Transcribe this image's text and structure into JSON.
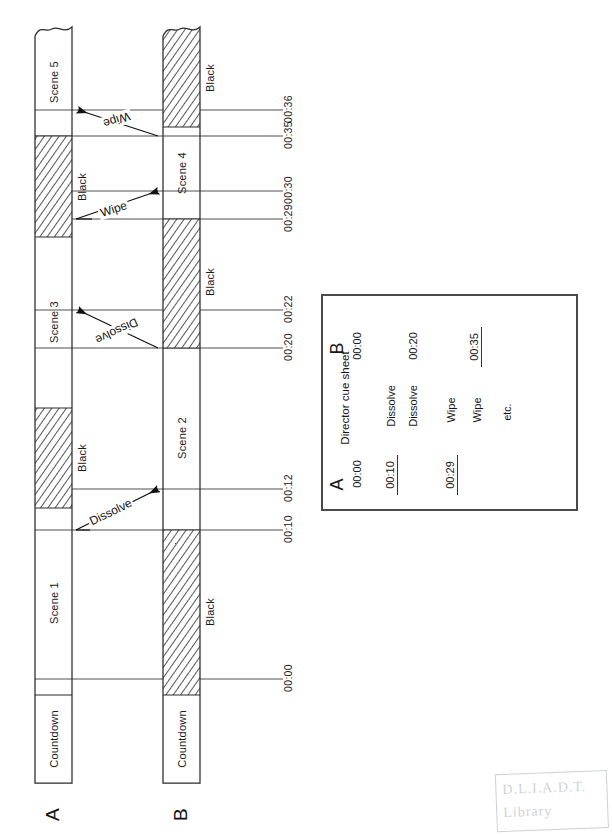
{
  "figure": {
    "type": "ab-roll-timeline-diagram",
    "tracks": [
      {
        "id": "A",
        "label": "A",
        "x": 35,
        "width": 37,
        "top_edge": "torn",
        "bands": [
          {
            "label": "Countdown",
            "fill": "white",
            "start_y": 695,
            "end_y": 783
          },
          {
            "label": "Scene 1",
            "fill": "white",
            "start_y": 508,
            "end_y": 695
          },
          {
            "label": "Black",
            "fill": "hatched",
            "start_y": 408,
            "end_y": 508
          },
          {
            "label": "Scene 3",
            "fill": "white",
            "start_y": 237,
            "end_y": 408
          },
          {
            "label": "Black",
            "fill": "hatched",
            "start_y": 136,
            "end_y": 237
          },
          {
            "label": "Scene 5",
            "fill": "white",
            "start_y": 26,
            "end_y": 136
          }
        ]
      },
      {
        "id": "B",
        "label": "B",
        "x": 163,
        "width": 37,
        "top_edge": "torn",
        "bands": [
          {
            "label": "Countdown",
            "fill": "white",
            "start_y": 695,
            "end_y": 783
          },
          {
            "label": "Black",
            "fill": "hatched",
            "start_y": 530,
            "end_y": 695
          },
          {
            "label": "Scene 2",
            "fill": "white",
            "start_y": 348,
            "end_y": 530
          },
          {
            "label": "Black",
            "fill": "hatched",
            "start_y": 219,
            "end_y": 348
          },
          {
            "label": "Scene 4",
            "fill": "white",
            "start_y": 127,
            "end_y": 219
          },
          {
            "label": "Black",
            "fill": "hatched",
            "start_y": 26,
            "end_y": 127
          }
        ]
      }
    ],
    "time_ticks": [
      {
        "time": "00:00",
        "y": 679
      },
      {
        "time": "00:10",
        "y": 530
      },
      {
        "time": "00:12",
        "y": 489
      },
      {
        "time": "00:20",
        "y": 348
      },
      {
        "time": "00:22",
        "y": 310
      },
      {
        "time": "00:29",
        "y": 219
      },
      {
        "time": "00:30",
        "y": 191
      },
      {
        "time": "00:35",
        "y": 136
      },
      {
        "time": "00:36",
        "y": 110
      }
    ],
    "transitions": [
      {
        "label": "Dissolve",
        "from_track": "A",
        "from_time": "00:10",
        "to_track": "B",
        "to_time": "00:12",
        "direction": "a-to-b"
      },
      {
        "label": "Dissolve",
        "from_track": "B",
        "from_time": "00:20",
        "to_track": "A",
        "to_time": "00:22",
        "direction": "b-to-a"
      },
      {
        "label": "Wipe",
        "from_track": "A",
        "from_time": "00:29",
        "to_track": "B",
        "to_time": "00:30",
        "direction": "a-to-b"
      },
      {
        "label": "Wipe",
        "from_track": "B",
        "from_time": "00:35",
        "to_track": "A",
        "to_time": "00:36",
        "direction": "b-to-a"
      }
    ]
  },
  "cue_sheet": {
    "title": "Director cue sheet",
    "column_a_header": "A",
    "column_b_header": "B",
    "rows": [
      {
        "a_time": "00:00",
        "a_underlined": false,
        "b_time": "00:00",
        "b_underlined": false,
        "transition": ""
      },
      {
        "a_time": "00:10",
        "a_underlined": true,
        "b_time": "",
        "b_underlined": false,
        "transition": "Dissolve"
      },
      {
        "a_time": "",
        "a_underlined": false,
        "b_time": "00:20",
        "b_underlined": false,
        "transition": "Dissolve"
      },
      {
        "a_time": "00:29",
        "a_underlined": true,
        "b_time": "",
        "b_underlined": false,
        "transition": "Wipe"
      },
      {
        "a_time": "",
        "a_underlined": false,
        "b_time": "00:35",
        "b_underlined": true,
        "transition": "Wipe"
      }
    ],
    "footer": "etc."
  },
  "stamp": {
    "line1": "D.L.I.A.D.T.",
    "line2": "Library"
  },
  "colors": {
    "ink": "#1a1a1a",
    "rule": "#333333",
    "hatch": "#2b2b2b",
    "paper": "#ffffff",
    "box_border": "#4a4a4a",
    "stamp": "#5d6b77"
  }
}
